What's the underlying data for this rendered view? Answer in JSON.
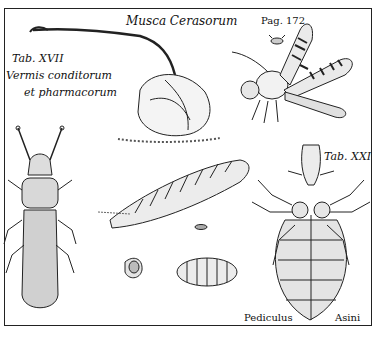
{
  "plate": {
    "title": "Musca Cerasorum",
    "page_ref": "Pag. 172",
    "table_left": "Tab. XVII",
    "caption_left_line1": "Vermis conditorum",
    "caption_left_line2": "et pharmacorum",
    "table_right": "Tab. XXI",
    "caption_bottom_left": "Pediculus",
    "caption_bottom_right": "Asini"
  },
  "figures": [
    {
      "name": "cherry-with-stalk"
    },
    {
      "name": "fly-large"
    },
    {
      "name": "fly-small"
    },
    {
      "name": "beetle"
    },
    {
      "name": "larva"
    },
    {
      "name": "pupa"
    },
    {
      "name": "pupa-case"
    },
    {
      "name": "louse"
    }
  ],
  "colors": {
    "ink": "#1a1a1a",
    "paper": "#ffffff"
  }
}
